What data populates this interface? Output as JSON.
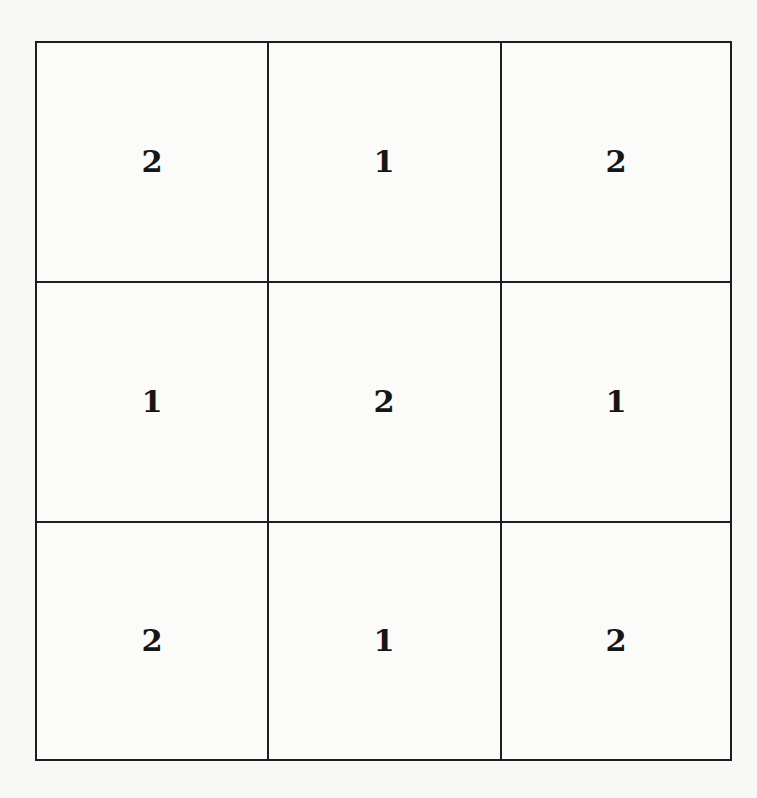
{
  "board": {
    "rows": 3,
    "cols": 3,
    "cells": [
      [
        "2",
        "1",
        "2"
      ],
      [
        "1",
        "2",
        "1"
      ],
      [
        "2",
        "1",
        "2"
      ]
    ]
  },
  "colors": {
    "background": "#f8f8f7",
    "grid_line": "#1e1e1e",
    "digit": "#161616"
  }
}
